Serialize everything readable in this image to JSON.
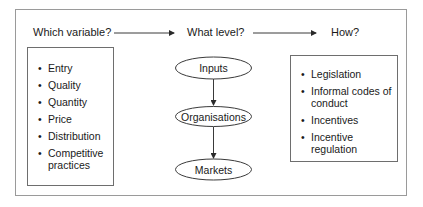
{
  "diagram": {
    "headings": {
      "which_variable": "Which variable?",
      "what_level": "What level?",
      "how": "How?"
    },
    "variables": [
      {
        "label": "Entry"
      },
      {
        "label": "Quality"
      },
      {
        "label": "Quantity"
      },
      {
        "label": "Price"
      },
      {
        "label": "Distribution"
      },
      {
        "label": "Competitive practices"
      }
    ],
    "levels": [
      {
        "label": "Inputs"
      },
      {
        "label": "Organisations"
      },
      {
        "label": "Markets"
      }
    ],
    "methods": [
      {
        "label": "Legislation"
      },
      {
        "label": "Informal codes of conduct"
      },
      {
        "label": "Incentives"
      },
      {
        "label": "Incentive regulation"
      }
    ],
    "colors": {
      "line": "#3a3a3a",
      "frame": "#9a9a9a",
      "text": "#1a1a1a"
    }
  }
}
